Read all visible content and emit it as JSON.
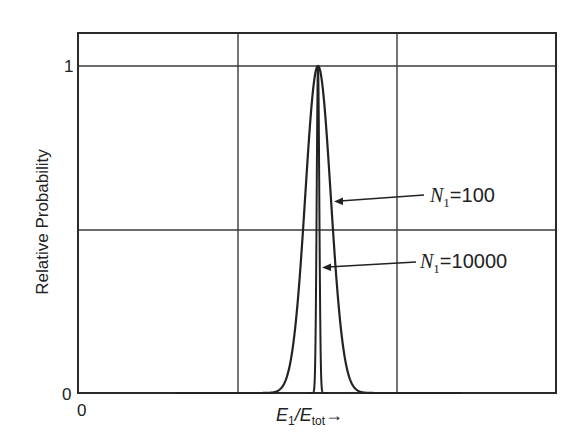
{
  "chart_data": {
    "type": "line",
    "title": "",
    "xlabel": "E1/Etot→",
    "xlabel_parts": {
      "main": "E",
      "sub1": "1",
      "slash": "/",
      "main2": "E",
      "sub2": "tot",
      "arrow": "→"
    },
    "ylabel": "Relative Probability",
    "x_ticks": [
      "0"
    ],
    "y_ticks": [
      "0",
      "1"
    ],
    "ylim": [
      0,
      1.1
    ],
    "grid": true,
    "legend": null,
    "series": [
      {
        "name": "N1=100",
        "shape": "gaussian",
        "peak": 1.0,
        "relative_width": "wide",
        "center_x_frac": 0.5
      },
      {
        "name": "N1=10000",
        "shape": "gaussian",
        "peak": 1.0,
        "relative_width": "narrow (≈10× narrower)",
        "center_x_frac": 0.5
      }
    ],
    "annotations": [
      {
        "label_var": "N",
        "label_sub": "1",
        "label_eq": "=",
        "label_val": "100",
        "points_to": "N1=100 curve"
      },
      {
        "label_var": "N",
        "label_sub": "1",
        "label_eq": "=",
        "label_val": "10000",
        "points_to": "N1=10000 curve"
      }
    ]
  },
  "axes": {
    "y_tick_top": "1",
    "y_tick_bottom": "0",
    "x_tick_left": "0",
    "ylabel": "Relative Probability"
  },
  "plot": {
    "left": 78,
    "right": 556,
    "top": 33,
    "bottom": 393,
    "y_one": 66,
    "grid_x": [
      238,
      397
    ],
    "grid_y": [
      66,
      230
    ],
    "center": 318,
    "sigma_wide": 12.7,
    "sigma_narrow": 1.3,
    "line_color": "#2a2a2a",
    "grid_color": "#3a3a3a"
  }
}
